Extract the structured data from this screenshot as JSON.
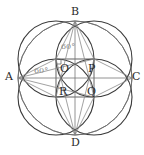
{
  "figure": {
    "canvas": {
      "width": 144,
      "height": 155,
      "background": "#ffffff"
    },
    "style": {
      "circle_stroke": "#3a3a3a",
      "circle_stroke_width": 1.1,
      "square_stroke": "#555555",
      "square_stroke_width": 0.9,
      "lens_stroke": "#6d6d6d",
      "lens_stroke_width": 0.9,
      "chord_stroke": "#8a8a8a",
      "chord_stroke_width": 0.8,
      "right_angle_stroke": "#777777",
      "label_color": "#2b2b2b",
      "angle_color": "#8a8a8a"
    },
    "geometry": {
      "center": {
        "x": 75,
        "y": 78
      },
      "square_half": 19,
      "circle_radius": 38,
      "outer_points": {
        "A": {
          "x": 18,
          "y": 78
        },
        "B": {
          "x": 75,
          "y": 21
        },
        "C": {
          "x": 132,
          "y": 78
        },
        "D": {
          "x": 75,
          "y": 135
        }
      },
      "square_corners": {
        "O": {
          "x": 56,
          "y": 59
        },
        "P": {
          "x": 94,
          "y": 59
        },
        "Q": {
          "x": 94,
          "y": 97
        },
        "R": {
          "x": 56,
          "y": 97
        }
      },
      "circle_centers": [
        {
          "name": "circle-top-left",
          "x": 56,
          "y": 59
        },
        {
          "name": "circle-top-right",
          "x": 94,
          "y": 59
        },
        {
          "name": "circle-bottom-right",
          "x": 94,
          "y": 97
        },
        {
          "name": "circle-bottom-left",
          "x": 56,
          "y": 97
        }
      ]
    },
    "point_labels": [
      {
        "name": "point-label-A",
        "text": "A",
        "x": 5,
        "y": 71
      },
      {
        "name": "point-label-B",
        "text": "B",
        "x": 71,
        "y": 6
      },
      {
        "name": "point-label-C",
        "text": "C",
        "x": 132,
        "y": 71
      },
      {
        "name": "point-label-D",
        "text": "D",
        "x": 71,
        "y": 137
      },
      {
        "name": "point-label-O",
        "text": "O",
        "x": 60,
        "y": 63
      },
      {
        "name": "point-label-P",
        "text": "P",
        "x": 88,
        "y": 63
      },
      {
        "name": "point-label-Q",
        "text": "Q",
        "x": 87,
        "y": 86
      },
      {
        "name": "point-label-R",
        "text": "R",
        "x": 59,
        "y": 86
      }
    ],
    "angle_labels": [
      {
        "name": "angle-label-top",
        "text": "60°",
        "x": 61,
        "y": 43
      },
      {
        "name": "angle-label-left",
        "text": "60°",
        "x": 34,
        "y": 67
      }
    ]
  }
}
